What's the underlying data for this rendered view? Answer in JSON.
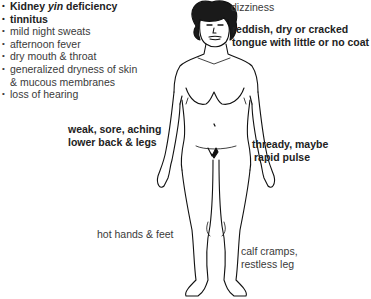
{
  "diagram": {
    "title": "Kidney yin deficiency",
    "title_parts": {
      "pre": "Kidney ",
      "italic": "yin",
      "post": " deficiency"
    },
    "symptom_list": [
      {
        "text": "tinnitus",
        "bold": true
      },
      {
        "text": "mild night sweats",
        "bold": false
      },
      {
        "text": "afternoon fever",
        "bold": false
      },
      {
        "text": "dry mouth & throat",
        "bold": false
      },
      {
        "text": "generalized dryness of skin",
        "continuation": "& mucous membranes",
        "bold": false
      },
      {
        "text": "loss of hearing",
        "bold": false
      }
    ],
    "labels": {
      "head": {
        "text": "dizziness",
        "bold": false
      },
      "tongue": {
        "line1": "reddish, dry or cracked",
        "line2": "tongue with little or no coat",
        "bold": true
      },
      "back": {
        "line1": "weak, sore, aching",
        "line2": "lower back & legs",
        "bold": true
      },
      "pulse": {
        "line1": "thready, maybe",
        "line2": "rapid pulse",
        "bold": true
      },
      "hands_feet": {
        "text": "hot hands & feet",
        "bold": false
      },
      "calves": {
        "line1": "calf cramps,",
        "line2": "restless leg",
        "bold": false
      }
    },
    "figure": {
      "description": "line drawing of standing female figure, front view",
      "stroke_color": "#111111"
    }
  }
}
